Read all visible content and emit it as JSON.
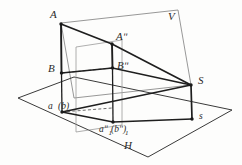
{
  "figure": {
    "name": "descriptive-geometry-projection",
    "type": "line-drawing",
    "background_color": "#fdfdfc",
    "ink_color": "#2b2b2b",
    "light_ink_color": "#8d8d8d",
    "labels": {
      "point_a": "A",
      "point_a_double_prime": "Aʺ",
      "point_b": "B",
      "point_b_double_prime": "Bʺ",
      "point_a_lower_paren_b": "a",
      "point_b_lower_paren": "(b)",
      "point_a1_double_prime": "aʺ",
      "point_b1_double_prime": "(bʺ)",
      "sub_1": "1",
      "plane_v": "V",
      "plane_h": "H",
      "point_s_upper": "S",
      "point_s_lower": "s"
    },
    "label_groups": {
      "ground_pair_left": "a (b)",
      "ground_pair_center": "aʺ₁(bʺ₁)"
    },
    "geometry_notes": {
      "planes": [
        "V",
        "H"
      ],
      "segments": [
        "A-B",
        "Aʺ-Bʺ",
        "a-b",
        "aʺ-bʺ"
      ],
      "apex_points": [
        "S",
        "s"
      ]
    }
  }
}
